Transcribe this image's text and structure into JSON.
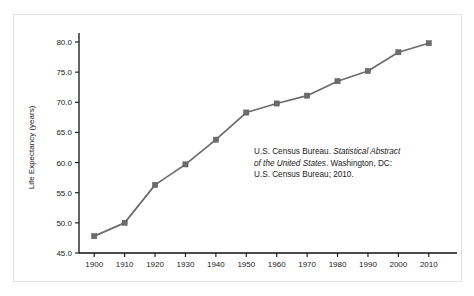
{
  "figure": {
    "border_color": "#e2e2e2",
    "background": "#ffffff"
  },
  "annotation": {
    "line1_a": "U.S. Census Bureau. ",
    "line1_b": "Statistical Abstract",
    "line2_a": "of the United States",
    "line2_b": ". Washington, DC:",
    "line3": "U.S. Census Bureau; 2010."
  },
  "chart_data": {
    "type": "line",
    "title": "",
    "xlabel": "",
    "ylabel": "Life Expectancy (years)",
    "x": [
      1900,
      1910,
      1920,
      1930,
      1940,
      1950,
      1960,
      1970,
      1980,
      1990,
      2000,
      2010
    ],
    "values": [
      47.8,
      50.0,
      56.3,
      59.7,
      63.8,
      68.3,
      69.8,
      71.1,
      73.5,
      75.2,
      78.3,
      79.8
    ],
    "xtick_labels": [
      "1900",
      "1910",
      "1920",
      "1930",
      "1940",
      "1950",
      "1960",
      "1970",
      "1980",
      "1990",
      "2000",
      "2010"
    ],
    "ytick_labels": [
      "45.0",
      "50.0",
      "55.0",
      "60.0",
      "65.0",
      "70.0",
      "75.0",
      "80.0"
    ],
    "ytick_values": [
      45.0,
      50.0,
      55.0,
      60.0,
      65.0,
      70.0,
      75.0,
      80.0
    ],
    "xlim": [
      1895,
      2015
    ],
    "ylim": [
      45.0,
      80.0
    ],
    "grid": false,
    "legend": false,
    "series_color": "#6b6b6b",
    "marker": "square",
    "axis_color": "#111111"
  }
}
